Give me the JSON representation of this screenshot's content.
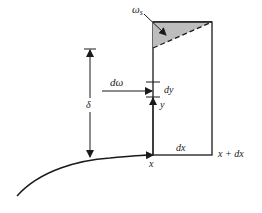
{
  "diagram": {
    "labels": {
      "omega_s": "ω",
      "omega_s_sub": "s",
      "d_omega": "dω",
      "delta": "δ",
      "dy": "dy",
      "y": "y",
      "x": "x",
      "dx": "dx",
      "x_plus_dx": "x + dx"
    },
    "colors": {
      "line": "#1a1a1a",
      "shaded_region": "#bdbdbd",
      "background": "#ffffff"
    }
  }
}
